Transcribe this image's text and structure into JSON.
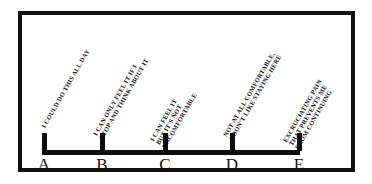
{
  "figure": {
    "type": "pain-rating-scale",
    "frame_color": "#101010",
    "bar_color": "#0d0d0d",
    "background": "#ffffff"
  },
  "scale": {
    "axis_start_x": 42,
    "axis_end_x": 297,
    "points": [
      {
        "letter": "A",
        "x": 42,
        "descriptor_lines": [
          "I COULD DO THIS ALL DAY"
        ]
      },
      {
        "letter": "B",
        "x": 100,
        "descriptor_lines": [
          "I CAN ONLY FEEL IT IF I",
          "STOP AND THINK ABOUT IT"
        ]
      },
      {
        "letter": "C",
        "x": 163,
        "descriptor_lines": [
          "I CAN FEEL IT",
          "BUT IT'S  NOT",
          "UNCOMFORTABLE"
        ]
      },
      {
        "letter": "D",
        "x": 230,
        "descriptor_lines": [
          "NOT AT ALL COMFORTABLE,",
          "I DON'T LIKE STAYING HERE"
        ]
      },
      {
        "letter": "E",
        "x": 297,
        "descriptor_lines": [
          "EXCRUCIATING PAIN",
          "THAT PREVENTS ME",
          "FROM CONTINUING"
        ]
      }
    ]
  }
}
